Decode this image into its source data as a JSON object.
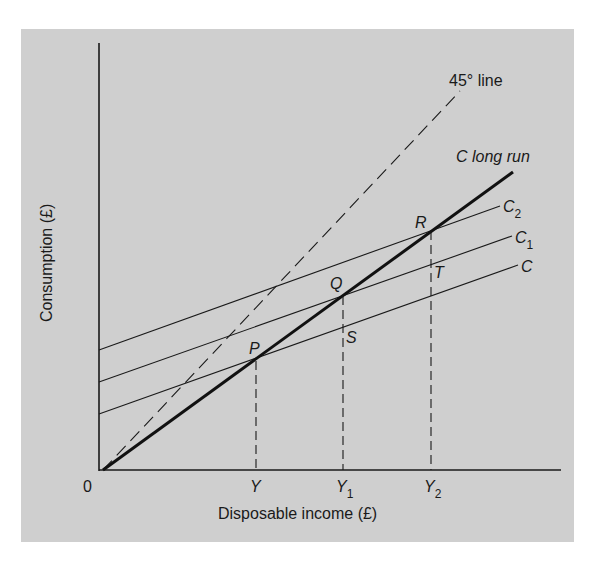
{
  "figure": {
    "background_color": "#cfcfcf",
    "line_color": "#1a1a1a",
    "axes": {
      "x_label": "Disposable income (£)",
      "y_label": "Consumption (£)",
      "origin_label": "0"
    },
    "x_ticks": [
      {
        "label": "Y",
        "sub": ""
      },
      {
        "label": "Y",
        "sub": "1"
      },
      {
        "label": "Y",
        "sub": "2"
      }
    ],
    "lines": {
      "forty_five": {
        "label": "45° line",
        "style": "dashed"
      },
      "long_run": {
        "label": "C long run",
        "style": "bold"
      },
      "c2": {
        "label": "C",
        "sub": "2"
      },
      "c1": {
        "label": "C",
        "sub": "1"
      },
      "c": {
        "label": "C",
        "sub": ""
      }
    },
    "points": {
      "p": "P",
      "q": "Q",
      "r": "R",
      "s": "S",
      "t": "T"
    }
  }
}
